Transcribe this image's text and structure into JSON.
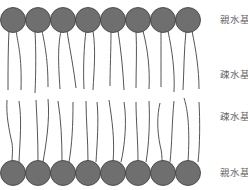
{
  "diagram": {
    "colors": {
      "head_fill": "#6f6f6f",
      "head_stroke": "#3a3a3a",
      "tail": "#555555",
      "label": "#666666"
    },
    "labels": [
      {
        "text": "親水基",
        "y": 14
      },
      {
        "text": "疎水基",
        "y": 69
      },
      {
        "text": "疎水基",
        "y": 111
      },
      {
        "text": "親水基",
        "y": 167
      }
    ],
    "top_row": {
      "y": 20,
      "xs": [
        13,
        38,
        63,
        88,
        113,
        138,
        163,
        188
      ],
      "r": 12.5
    },
    "bottom_row": {
      "y": 173,
      "xs": [
        13,
        38,
        63,
        88,
        113,
        138,
        163,
        188
      ],
      "r": 12.5
    }
  },
  "labels": {
    "top_hydrophilic": "親水基",
    "top_hydrophobic": "疎水基",
    "bottom_hydrophobic": "疎水基",
    "bottom_hydrophilic": "親水基"
  }
}
